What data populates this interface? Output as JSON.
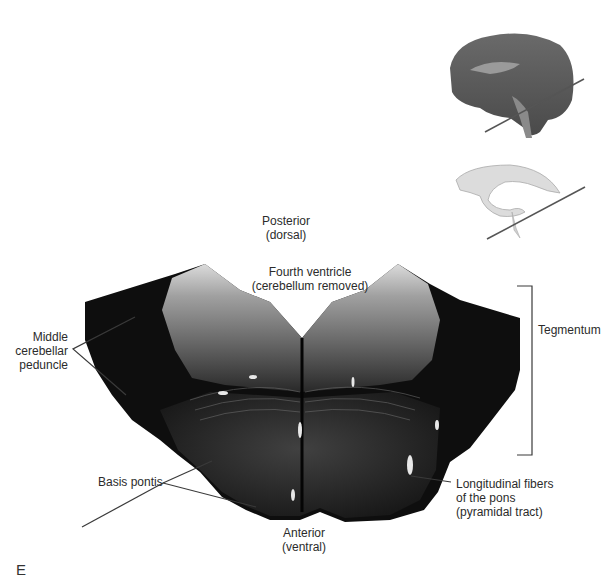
{
  "figure": {
    "panel_letter": "E",
    "orientation": {
      "top_line1": "Posterior",
      "top_line2": "(dorsal)",
      "bottom_line1": "Anterior",
      "bottom_line2": "(ventral)"
    },
    "labels": {
      "fourth_ventricle_line1": "Fourth ventricle",
      "fourth_ventricle_line2": "(cerebellum removed)",
      "middle_cerebellar_line1": "Middle",
      "middle_cerebellar_line2": "cerebellar",
      "middle_cerebellar_line3": "peduncle",
      "tegmentum": "Tegmentum",
      "basis_pontis": "Basis pontis",
      "longitudinal_line1": "Longitudinal fibers",
      "longitudinal_line2": "of the pons",
      "longitudinal_line3": "(pyramidal tract)"
    },
    "colors": {
      "section_dark": "#0e0e0e",
      "tegmentum_gray": "#9a9a9a",
      "leader_line": "#3a3a3a",
      "brain_thumb": "#5a5a5a",
      "ventricle_thumb": "#d8d8d8"
    }
  }
}
